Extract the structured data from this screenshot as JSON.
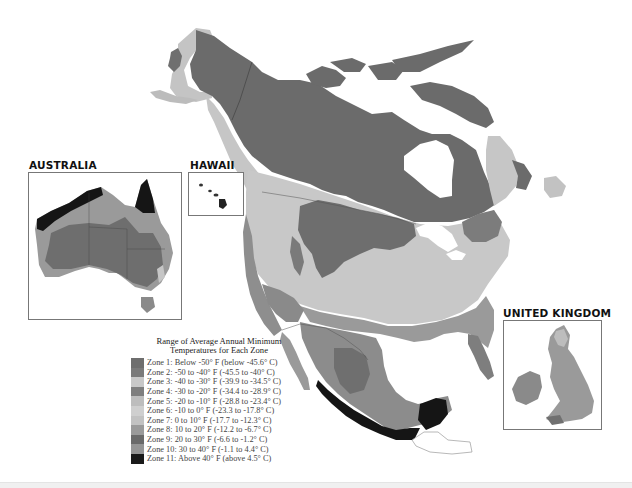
{
  "map": {
    "region": "North America",
    "insets": {
      "australia": {
        "title": "AUSTRALIA"
      },
      "hawaii": {
        "title": "HAWAII"
      },
      "united_kingdom": {
        "title": "UNITED KINGDOM"
      }
    }
  },
  "legend": {
    "title_line1": "Range of Average Annual Minimum",
    "title_line2": "Temperatures for Each Zone",
    "zones": [
      {
        "label": "Zone 1:  Below -50° F (below -45.6° C)",
        "color": "#6e6e6e"
      },
      {
        "label": "Zone 2:  -50 to -40° F (-45.5 to -40° C)",
        "color": "#7a7a7a"
      },
      {
        "label": "Zone 3:  -40 to -30° F (-39.9 to -34.5° C)",
        "color": "#c8c8c8"
      },
      {
        "label": "Zone 4:  -30 to -20° F (-34.4 to -28.9° C)",
        "color": "#7e7e7e"
      },
      {
        "label": "Zone 5:  -20 to -10° F (-28.8 to -23.4° C)",
        "color": "#bdbdbd"
      },
      {
        "label": "Zone 6:  -10 to 0° F (-23.3 to -17.8° C)",
        "color": "#cfcfcf"
      },
      {
        "label": "Zone 7:  0 to 10° F (-17.7 to -12.3° C)",
        "color": "#c2c2c2"
      },
      {
        "label": "Zone 8:  10 to 20° F (-12.2 to -6.7° C)",
        "color": "#9a9a9a"
      },
      {
        "label": "Zone 9:  20 to 30° F (-6.6 to -1.2° C)",
        "color": "#6a6a6a"
      },
      {
        "label": "Zone 10:  30 to 40° F (-1.1 to 4.4° C)",
        "color": "#959595"
      },
      {
        "label": "Zone 11:  Above 40° F (above 4.5° C)",
        "color": "#1a1a1a"
      }
    ]
  }
}
